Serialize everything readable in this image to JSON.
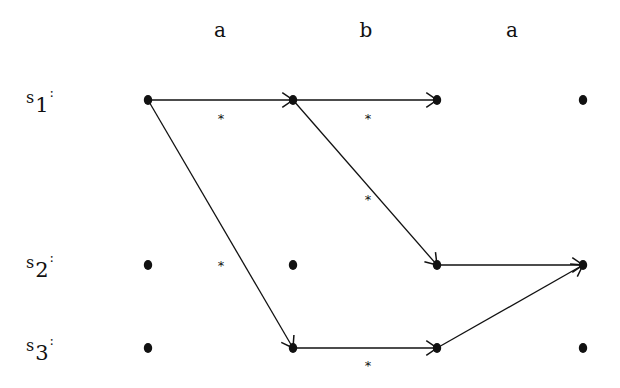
{
  "diagram": {
    "type": "run-graph",
    "input_symbols": [
      "a",
      "b",
      "a"
    ],
    "states": [
      {
        "name": "s",
        "index": "1",
        "colon": ":"
      },
      {
        "name": "s",
        "index": "2",
        "colon": ":"
      },
      {
        "name": "s",
        "index": "3",
        "colon": ":"
      }
    ],
    "columns_x": [
      148,
      293,
      437,
      583
    ],
    "rows_y": [
      100,
      265,
      348
    ],
    "edges": [
      {
        "from": [
          0,
          0
        ],
        "to": [
          1,
          0
        ]
      },
      {
        "from": [
          0,
          0
        ],
        "to": [
          1,
          2
        ]
      },
      {
        "from": [
          1,
          0
        ],
        "to": [
          2,
          0
        ]
      },
      {
        "from": [
          1,
          0
        ],
        "to": [
          2,
          1
        ]
      },
      {
        "from": [
          1,
          2
        ],
        "to": [
          2,
          2
        ]
      },
      {
        "from": [
          2,
          1
        ],
        "to": [
          3,
          1
        ]
      },
      {
        "from": [
          2,
          2
        ],
        "to": [
          3,
          1
        ]
      }
    ],
    "asterisks": [
      {
        "x": 221,
        "y": 118
      },
      {
        "x": 368,
        "y": 118
      },
      {
        "x": 368,
        "y": 199
      },
      {
        "x": 221,
        "y": 265
      },
      {
        "x": 368,
        "y": 365
      }
    ],
    "colors": {
      "ink": "#111111",
      "background": "#ffffff"
    }
  }
}
